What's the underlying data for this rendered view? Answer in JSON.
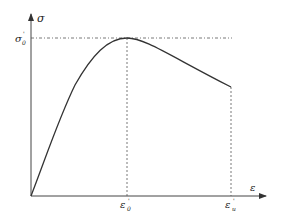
{
  "diagram": {
    "type": "stress-strain curve",
    "y_axis": {
      "label": "σ"
    },
    "x_axis": {
      "label": "ε"
    },
    "peak_stress_label": {
      "base": "σ",
      "sub": "0",
      "sup": "'"
    },
    "peak_strain_label": {
      "base": "ε",
      "sub": "0",
      "sup": "'"
    },
    "ultimate_strain_label": {
      "base": "ε",
      "sub": "u",
      "sup": "'"
    },
    "colors": {
      "curve": "#333333",
      "axis": "#444444",
      "dashed": "#555555",
      "background": "#ffffff"
    }
  }
}
